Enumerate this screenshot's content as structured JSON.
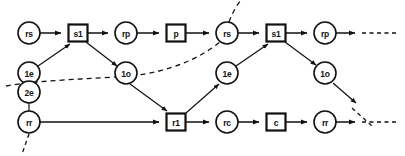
{
  "diagram": {
    "type": "directed-graph",
    "width": 405,
    "height": 156,
    "background_color": "#ffffff",
    "stroke_color": "#111111",
    "rows": {
      "top": 33,
      "upper_mid": 73,
      "lower_mid": 92,
      "bottom": 122
    },
    "nodes": [
      {
        "id": "rs-1",
        "label": "rs",
        "shape": "circle",
        "x": 29,
        "y": 33,
        "r": 11
      },
      {
        "id": "s1-1",
        "label": "s1",
        "shape": "box",
        "x": 78,
        "y": 33,
        "w": 19,
        "h": 17
      },
      {
        "id": "rp-1",
        "label": "rp",
        "shape": "circle",
        "x": 126,
        "y": 33,
        "r": 11
      },
      {
        "id": "p-1",
        "label": "p",
        "shape": "box",
        "x": 176,
        "y": 33,
        "w": 19,
        "h": 17
      },
      {
        "id": "rs-2",
        "label": "rs",
        "shape": "circle",
        "x": 227,
        "y": 33,
        "r": 11
      },
      {
        "id": "s1-2",
        "label": "s1",
        "shape": "box",
        "x": 276,
        "y": 33,
        "w": 19,
        "h": 17
      },
      {
        "id": "rp-2",
        "label": "rp",
        "shape": "circle",
        "x": 325,
        "y": 33,
        "r": 11
      },
      {
        "id": "1e-1",
        "label": "1e",
        "shape": "circle",
        "x": 29,
        "y": 73,
        "r": 11
      },
      {
        "id": "1o-1",
        "label": "1o",
        "shape": "circle",
        "x": 126,
        "y": 73,
        "r": 11
      },
      {
        "id": "1e-2",
        "label": "1e",
        "shape": "circle",
        "x": 227,
        "y": 73,
        "r": 11
      },
      {
        "id": "1o-2",
        "label": "1o",
        "shape": "circle",
        "x": 325,
        "y": 73,
        "r": 11
      },
      {
        "id": "2e-1",
        "label": "2e",
        "shape": "circle",
        "x": 29,
        "y": 92,
        "r": 11
      },
      {
        "id": "rr-1",
        "label": "rr",
        "shape": "circle",
        "x": 29,
        "y": 122,
        "r": 11
      },
      {
        "id": "r1-1",
        "label": "r1",
        "shape": "box",
        "x": 176,
        "y": 122,
        "w": 19,
        "h": 17
      },
      {
        "id": "rc-1",
        "label": "rc",
        "shape": "circle",
        "x": 227,
        "y": 122,
        "r": 11
      },
      {
        "id": "c-1",
        "label": "c",
        "shape": "box",
        "x": 276,
        "y": 122,
        "w": 19,
        "h": 17
      },
      {
        "id": "rr-2",
        "label": "rr",
        "shape": "circle",
        "x": 325,
        "y": 122,
        "r": 11
      }
    ],
    "edges": [
      {
        "id": "e-rs1-s1-1",
        "from": "rs-1",
        "to": "s1-1",
        "style": "solid",
        "arrow": true
      },
      {
        "id": "e-s1-1-rp1",
        "from": "s1-1",
        "to": "rp-1",
        "style": "solid",
        "arrow": true
      },
      {
        "id": "e-rp1-p1",
        "from": "rp-1",
        "to": "p-1",
        "style": "solid",
        "arrow": true
      },
      {
        "id": "e-p1-rs2",
        "from": "p-1",
        "to": "rs-2",
        "style": "solid",
        "arrow": true
      },
      {
        "id": "e-rs2-s1-2",
        "from": "rs-2",
        "to": "s1-2",
        "style": "solid",
        "arrow": true
      },
      {
        "id": "e-s1-2-rp2",
        "from": "s1-2",
        "to": "rp-2",
        "style": "solid",
        "arrow": true
      },
      {
        "id": "e-rp2-out",
        "from": "rp-2",
        "to": "edge-right-top",
        "style": "solid-then-dashed",
        "arrow": true
      },
      {
        "id": "e-1e1-s1-1",
        "from": "1e-1",
        "to": "s1-1",
        "style": "solid",
        "arrow": true
      },
      {
        "id": "e-s1-1-1o1",
        "from": "s1-1",
        "to": "1o-1",
        "style": "solid",
        "arrow": true
      },
      {
        "id": "e-1o1-r1",
        "from": "1o-1",
        "to": "r1-1",
        "style": "solid",
        "arrow": true
      },
      {
        "id": "e-1e2-s1-2",
        "from": "1e-2",
        "to": "s1-2",
        "style": "solid",
        "arrow": true
      },
      {
        "id": "e-s1-2-1o2",
        "from": "s1-2",
        "to": "1o-2",
        "style": "solid",
        "arrow": true
      },
      {
        "id": "e-r1-1e2",
        "from": "r1-1",
        "to": "1e-2",
        "style": "solid",
        "arrow": true
      },
      {
        "id": "e-2e1-rr1",
        "from": "2e-1",
        "to": "rr-1",
        "style": "solid",
        "arrow": false
      },
      {
        "id": "e-rr1-r1",
        "from": "rr-1",
        "to": "r1-1",
        "style": "solid",
        "arrow": true
      },
      {
        "id": "e-r1-rc1",
        "from": "r1-1",
        "to": "rc-1",
        "style": "solid",
        "arrow": true
      },
      {
        "id": "e-rc1-c1",
        "from": "rc-1",
        "to": "c-1",
        "style": "solid",
        "arrow": true
      },
      {
        "id": "e-c1-rr2",
        "from": "c-1",
        "to": "rr-2",
        "style": "solid",
        "arrow": true
      },
      {
        "id": "e-rr2-out",
        "from": "rr-2",
        "to": "edge-right-bottom",
        "style": "solid-then-dashed",
        "arrow": true
      },
      {
        "id": "e-dashed-curve-in",
        "from": "off-screen-lower-left",
        "to": "rs-2",
        "style": "dashed",
        "arrow": false
      },
      {
        "id": "e-dashed-up-out",
        "from": "rs-2",
        "to": "off-screen-top",
        "style": "dashed",
        "arrow": false
      },
      {
        "id": "e-1o2-dashed-out",
        "from": "1o-2",
        "to": "off-screen-lower-right",
        "style": "solid-then-dashed",
        "arrow": true
      },
      {
        "id": "e-rr1-dashed-down",
        "from": "rr-1",
        "to": "off-screen-bottom",
        "style": "dashed",
        "arrow": false
      }
    ]
  }
}
